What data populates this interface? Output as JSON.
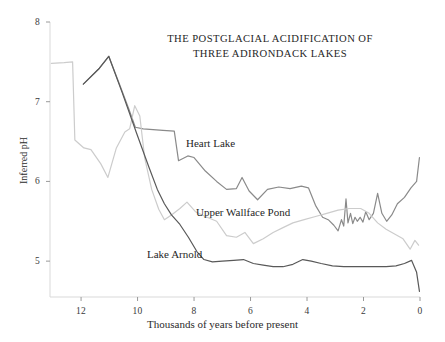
{
  "chart_data": {
    "type": "line",
    "title": "THE POSTGLACIAL ACIDIFICATION OF THREE ADIRONDACK LAKES",
    "title_line1": "THE POSTGLACIAL ACIDIFICATION OF",
    "title_line2": "THREE ADIRONDACK LAKES",
    "xlabel": "Thousands of years before present",
    "ylabel": "Inferred pH",
    "xlim": [
      13.1,
      0
    ],
    "ylim": [
      4.55,
      8
    ],
    "x_ticks": [
      "12",
      "10",
      "8",
      "6",
      "4",
      "2",
      "0"
    ],
    "x_tick_values": [
      12,
      10,
      8,
      6,
      4,
      2,
      0
    ],
    "y_ticks": [
      "5",
      "6",
      "7",
      "8"
    ],
    "y_tick_values": [
      5,
      6,
      7,
      8
    ],
    "x_axis_direction": "reversed",
    "grid": false,
    "legend_position": "inline-labels",
    "series": [
      {
        "name": "Heart Lake",
        "color": "#8a8a8a",
        "label_position": "inline",
        "points": [
          [
            11.92,
            7.22
          ],
          [
            11.35,
            7.42
          ],
          [
            11.02,
            7.57
          ],
          [
            10.62,
            7.2
          ],
          [
            10.3,
            6.9
          ],
          [
            10.08,
            6.68
          ],
          [
            9.8,
            6.66
          ],
          [
            9.1,
            6.64
          ],
          [
            8.7,
            6.63
          ],
          [
            8.55,
            6.26
          ],
          [
            8.22,
            6.32
          ],
          [
            8.0,
            6.3
          ],
          [
            7.6,
            6.13
          ],
          [
            7.2,
            6.0
          ],
          [
            6.85,
            5.9
          ],
          [
            6.5,
            5.91
          ],
          [
            6.3,
            6.05
          ],
          [
            6.05,
            5.88
          ],
          [
            5.75,
            5.77
          ],
          [
            5.4,
            5.9
          ],
          [
            5.0,
            5.93
          ],
          [
            4.6,
            5.91
          ],
          [
            4.2,
            5.94
          ],
          [
            3.95,
            5.92
          ],
          [
            3.7,
            5.7
          ],
          [
            3.45,
            5.55
          ],
          [
            3.25,
            5.52
          ],
          [
            3.05,
            5.45
          ],
          [
            2.9,
            5.38
          ],
          [
            2.78,
            5.52
          ],
          [
            2.7,
            5.44
          ],
          [
            2.62,
            5.78
          ],
          [
            2.55,
            5.48
          ],
          [
            2.46,
            5.6
          ],
          [
            2.38,
            5.47
          ],
          [
            2.3,
            5.55
          ],
          [
            2.22,
            5.5
          ],
          [
            2.12,
            5.55
          ],
          [
            2.02,
            5.49
          ],
          [
            1.92,
            5.62
          ],
          [
            1.8,
            5.52
          ],
          [
            1.65,
            5.6
          ],
          [
            1.5,
            5.85
          ],
          [
            1.35,
            5.6
          ],
          [
            1.18,
            5.5
          ],
          [
            1.0,
            5.58
          ],
          [
            0.8,
            5.72
          ],
          [
            0.55,
            5.8
          ],
          [
            0.32,
            5.92
          ],
          [
            0.12,
            6.0
          ],
          [
            0.02,
            6.3
          ]
        ]
      },
      {
        "name": "Upper Wallface Pond",
        "color": "#cccccc",
        "label_position": "inline",
        "points": [
          [
            13.05,
            7.48
          ],
          [
            12.6,
            7.49
          ],
          [
            12.3,
            7.5
          ],
          [
            12.22,
            6.52
          ],
          [
            11.9,
            6.42
          ],
          [
            11.65,
            6.4
          ],
          [
            11.3,
            6.22
          ],
          [
            11.05,
            6.05
          ],
          [
            10.75,
            6.42
          ],
          [
            10.45,
            6.62
          ],
          [
            10.28,
            6.66
          ],
          [
            10.1,
            6.95
          ],
          [
            9.92,
            6.82
          ],
          [
            9.75,
            6.3
          ],
          [
            9.5,
            5.9
          ],
          [
            9.25,
            5.65
          ],
          [
            9.05,
            5.52
          ],
          [
            8.8,
            5.58
          ],
          [
            8.5,
            5.66
          ],
          [
            8.25,
            5.74
          ],
          [
            7.95,
            5.62
          ],
          [
            7.6,
            5.56
          ],
          [
            7.2,
            5.5
          ],
          [
            6.85,
            5.32
          ],
          [
            6.5,
            5.3
          ],
          [
            6.2,
            5.36
          ],
          [
            5.9,
            5.22
          ],
          [
            5.55,
            5.28
          ],
          [
            5.2,
            5.36
          ],
          [
            4.85,
            5.42
          ],
          [
            4.5,
            5.48
          ],
          [
            4.1,
            5.52
          ],
          [
            3.7,
            5.56
          ],
          [
            3.3,
            5.6
          ],
          [
            2.9,
            5.64
          ],
          [
            2.5,
            5.66
          ],
          [
            2.1,
            5.66
          ],
          [
            1.8,
            5.6
          ],
          [
            1.5,
            5.48
          ],
          [
            1.2,
            5.4
          ],
          [
            0.9,
            5.34
          ],
          [
            0.6,
            5.28
          ],
          [
            0.35,
            5.15
          ],
          [
            0.18,
            5.26
          ],
          [
            0.05,
            5.2
          ]
        ]
      },
      {
        "name": "Lake Arnold",
        "color": "#595959",
        "label_position": "inline",
        "points": [
          [
            11.92,
            7.22
          ],
          [
            11.35,
            7.42
          ],
          [
            11.02,
            7.57
          ],
          [
            10.55,
            7.12
          ],
          [
            10.05,
            6.62
          ],
          [
            9.6,
            6.18
          ],
          [
            9.3,
            5.9
          ],
          [
            9.05,
            5.72
          ],
          [
            8.8,
            5.58
          ],
          [
            8.5,
            5.46
          ],
          [
            8.2,
            5.3
          ],
          [
            7.9,
            5.12
          ],
          [
            7.65,
            5.02
          ],
          [
            7.35,
            4.99
          ],
          [
            7.0,
            5.0
          ],
          [
            6.6,
            5.01
          ],
          [
            6.25,
            5.02
          ],
          [
            5.9,
            4.97
          ],
          [
            5.55,
            4.95
          ],
          [
            5.2,
            4.93
          ],
          [
            4.85,
            4.93
          ],
          [
            4.5,
            4.96
          ],
          [
            4.15,
            5.02
          ],
          [
            3.85,
            5.0
          ],
          [
            3.5,
            4.97
          ],
          [
            3.1,
            4.94
          ],
          [
            2.7,
            4.93
          ],
          [
            2.3,
            4.93
          ],
          [
            1.9,
            4.93
          ],
          [
            1.55,
            4.93
          ],
          [
            1.2,
            4.93
          ],
          [
            0.85,
            4.94
          ],
          [
            0.55,
            4.97
          ],
          [
            0.3,
            5.01
          ],
          [
            0.12,
            4.86
          ],
          [
            0.02,
            4.62
          ]
        ]
      }
    ]
  }
}
